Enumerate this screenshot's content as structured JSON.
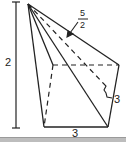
{
  "diagram": {
    "type": "pyramid-geometry-figure",
    "labels": {
      "height": "2",
      "bottom_edge": "3",
      "right_edge": "3",
      "slant_numerator": "5",
      "slant_denominator": "2"
    },
    "colors": {
      "stroke": "#222222",
      "background": "#ffffff",
      "footer_bar": "#bdbdbd"
    }
  }
}
